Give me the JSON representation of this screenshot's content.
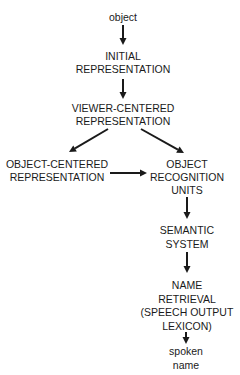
{
  "diagram": {
    "type": "flowchart",
    "nodes": [
      {
        "id": "object",
        "lines": [
          "object"
        ]
      },
      {
        "id": "initial",
        "lines": [
          "INITIAL",
          "REPRESENTATION"
        ]
      },
      {
        "id": "viewer",
        "lines": [
          "VIEWER-CENTERED",
          "REPRESENTATION"
        ]
      },
      {
        "id": "objcentered",
        "lines": [
          "OBJECT-CENTERED",
          "REPRESENTATION"
        ]
      },
      {
        "id": "oru",
        "lines": [
          "OBJECT",
          "RECOGNITION",
          "UNITS"
        ]
      },
      {
        "id": "semantic",
        "lines": [
          "SEMANTIC",
          "SYSTEM"
        ]
      },
      {
        "id": "name",
        "lines": [
          "NAME",
          "RETRIEVAL",
          "(SPEECH OUTPUT",
          "LEXICON)"
        ]
      },
      {
        "id": "spoken",
        "lines": [
          "spoken",
          "name"
        ]
      }
    ],
    "edges": [
      {
        "from": "object",
        "to": "initial"
      },
      {
        "from": "initial",
        "to": "viewer"
      },
      {
        "from": "viewer",
        "to": "objcentered"
      },
      {
        "from": "viewer",
        "to": "oru"
      },
      {
        "from": "objcentered",
        "to": "oru"
      },
      {
        "from": "oru",
        "to": "semantic"
      },
      {
        "from": "semantic",
        "to": "name"
      },
      {
        "from": "name",
        "to": "spoken"
      }
    ]
  }
}
